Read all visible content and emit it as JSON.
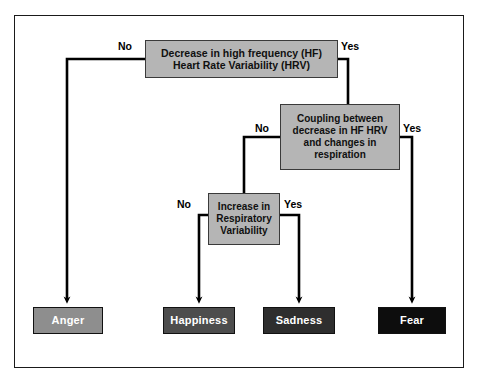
{
  "diagram": {
    "type": "flowchart",
    "background_color": "#ffffff",
    "frame_color": "#1a1a1a",
    "decision_fill": "#b5b5b5",
    "connector_color": "#000000"
  },
  "nodes": {
    "hrv": {
      "label": "Decrease in high frequency (HF)\nHeart Rate Variability (HRV)",
      "line1": "Decrease in high frequency (HF)",
      "line2": "Heart Rate Variability (HRV)",
      "kind": "decision"
    },
    "coupling": {
      "line1": "Coupling between",
      "line2": "decrease in HF HRV",
      "line3": "and changes in",
      "line4": "respiration",
      "kind": "decision"
    },
    "respiratory": {
      "line1": "Increase in",
      "line2": "Respiratory",
      "line3": "Variability",
      "kind": "decision"
    },
    "anger": {
      "label": "Anger",
      "kind": "outcome",
      "fill": "#8e8e8e"
    },
    "happiness": {
      "label": "Happiness",
      "kind": "outcome",
      "fill": "#4d4d4d"
    },
    "sadness": {
      "label": "Sadness",
      "kind": "outcome",
      "fill": "#2e2e2e"
    },
    "fear": {
      "label": "Fear",
      "kind": "outcome",
      "fill": "#0d0d0d"
    }
  },
  "edges": {
    "hrv_no": {
      "label": "No",
      "from": "hrv",
      "to": "anger"
    },
    "hrv_yes": {
      "label": "Yes",
      "from": "hrv",
      "to": "coupling"
    },
    "coupling_no": {
      "label": "No",
      "from": "coupling",
      "to": "respiratory"
    },
    "coupling_yes": {
      "label": "Yes",
      "from": "coupling",
      "to": "fear"
    },
    "resp_no": {
      "label": "No",
      "from": "respiratory",
      "to": "happiness"
    },
    "resp_yes": {
      "label": "Yes",
      "from": "respiratory",
      "to": "sadness"
    }
  }
}
